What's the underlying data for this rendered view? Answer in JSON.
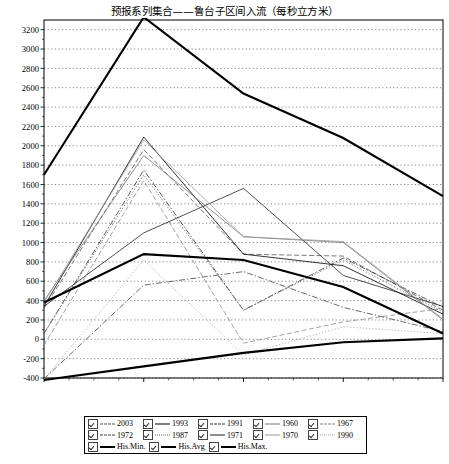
{
  "chart_title": "预报系列集合——鲁台子区间入流（每秒立方米）",
  "axis": {
    "x_ticks": [
      "2006-6-1",
      "2006-7-1",
      "2006-8-1",
      "2006-9-1",
      "2006-10-1"
    ],
    "y_ticks": [
      "3200",
      "3000",
      "2800",
      "2600",
      "2400",
      "2200",
      "2000",
      "1800",
      "1600",
      "1400",
      "1200",
      "1000",
      "800",
      "600",
      "400",
      "200",
      "0",
      "-200",
      "-400"
    ]
  },
  "legend": {
    "rows": [
      [
        {
          "label": "2003",
          "checked": true,
          "style": "dashed",
          "color": "#555555",
          "width": 0.8
        },
        {
          "label": "1993",
          "checked": true,
          "style": "solid",
          "color": "#000000",
          "width": 0.8
        },
        {
          "label": "1991",
          "checked": true,
          "style": "dashdot",
          "color": "#333333",
          "width": 0.8
        },
        {
          "label": "1960",
          "checked": true,
          "style": "solid",
          "color": "#777777",
          "width": 0.8
        },
        {
          "label": "1967",
          "checked": true,
          "style": "dashed",
          "color": "#888888",
          "width": 0.8
        }
      ],
      [
        {
          "label": "1972",
          "checked": true,
          "style": "dashdot",
          "color": "#444444",
          "width": 0.8
        },
        {
          "label": "1987",
          "checked": true,
          "style": "dotted",
          "color": "#666666",
          "width": 0.8
        },
        {
          "label": "1971",
          "checked": true,
          "style": "solid",
          "color": "#222222",
          "width": 0.8
        },
        {
          "label": "1970",
          "checked": true,
          "style": "solid",
          "color": "#999999",
          "width": 0.8
        },
        {
          "label": "1990",
          "checked": true,
          "style": "dotted",
          "color": "#aaaaaa",
          "width": 0.8
        }
      ],
      [
        {
          "label": "His.Min.",
          "checked": true,
          "style": "solid",
          "color": "#000000",
          "width": 2.1
        },
        {
          "label": "His.Avg",
          "checked": true,
          "style": "solid",
          "color": "#000000",
          "width": 2.1
        },
        {
          "label": "His.Max.",
          "checked": true,
          "style": "solid",
          "color": "#000000",
          "width": 2.1
        }
      ]
    ]
  },
  "chart_data": {
    "type": "line",
    "title": "预报系列集合——鲁台子区间入流（每秒立方米）",
    "xlabel": "",
    "ylabel": "",
    "x": [
      "2006-6-1",
      "2006-7-1",
      "2006-8-1",
      "2006-9-1",
      "2006-10-1"
    ],
    "ylim": [
      -400,
      3300
    ],
    "ytick_step": 200,
    "grid": true,
    "legend_position": "below",
    "series": [
      {
        "name": "2003",
        "values": [
          320,
          1960,
          880,
          860,
          300
        ],
        "style": "dashed",
        "color": "#555555",
        "width": 0.8
      },
      {
        "name": "1993",
        "values": [
          340,
          2090,
          880,
          760,
          260
        ],
        "style": "solid",
        "color": "#000000",
        "width": 0.8
      },
      {
        "name": "1991",
        "values": [
          60,
          1750,
          300,
          840,
          330
        ],
        "style": "dashdot",
        "color": "#333333",
        "width": 0.8
      },
      {
        "name": "1960",
        "values": [
          400,
          1900,
          1060,
          1000,
          200
        ],
        "style": "solid",
        "color": "#777777",
        "width": 0.8
      },
      {
        "name": "1967",
        "values": [
          -60,
          1640,
          -40,
          180,
          320
        ],
        "style": "dashed",
        "color": "#888888",
        "width": 0.8
      },
      {
        "name": "1972",
        "values": [
          -410,
          560,
          700,
          330,
          80
        ],
        "style": "dashdot",
        "color": "#444444",
        "width": 0.8
      },
      {
        "name": "1987",
        "values": [
          60,
          1700,
          300,
          820,
          280
        ],
        "style": "dotted",
        "color": "#666666",
        "width": 0.8
      },
      {
        "name": "1971",
        "values": [
          340,
          1100,
          1560,
          660,
          340
        ],
        "style": "solid",
        "color": "#222222",
        "width": 0.8
      },
      {
        "name": "1970",
        "values": [
          380,
          2060,
          1060,
          1010,
          210
        ],
        "style": "solid",
        "color": "#999999",
        "width": 0.8
      },
      {
        "name": "1990",
        "values": [
          -410,
          820,
          -160,
          130,
          60
        ],
        "style": "dotted",
        "color": "#aaaaaa",
        "width": 0.8
      },
      {
        "name": "His.Min.",
        "values": [
          -420,
          -280,
          -140,
          -30,
          10
        ],
        "style": "solid",
        "color": "#000000",
        "width": 2.1
      },
      {
        "name": "His.Avg",
        "values": [
          380,
          880,
          820,
          540,
          60
        ],
        "style": "solid",
        "color": "#000000",
        "width": 2.1
      },
      {
        "name": "His.Max.",
        "values": [
          1700,
          3330,
          2540,
          2080,
          1480
        ],
        "style": "solid",
        "color": "#000000",
        "width": 2.1
      }
    ]
  }
}
